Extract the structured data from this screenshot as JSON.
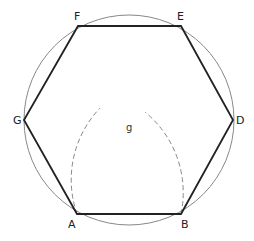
{
  "diagram": {
    "colors": {
      "background": "#ffffff",
      "hexagon_stroke": "#222222",
      "circle_stroke": "#888888",
      "arc_stroke": "#888888",
      "label": "#222222"
    },
    "circle": {
      "cx": 129,
      "cy": 120,
      "r": 105
    },
    "vertices": [
      {
        "id": "A",
        "label": "A",
        "x": 77,
        "y": 214,
        "lx": 68,
        "ly": 228
      },
      {
        "id": "B",
        "label": "B",
        "x": 181,
        "y": 214,
        "lx": 181,
        "ly": 228
      },
      {
        "id": "D",
        "label": "D",
        "x": 233,
        "y": 120,
        "lx": 236,
        "ly": 124
      },
      {
        "id": "E",
        "label": "E",
        "x": 181,
        "y": 26,
        "lx": 177,
        "ly": 20
      },
      {
        "id": "F",
        "label": "F",
        "x": 78,
        "y": 26,
        "lx": 74,
        "ly": 20
      },
      {
        "id": "G",
        "label": "G",
        "x": 24,
        "y": 120,
        "lx": 13,
        "ly": 124
      }
    ],
    "construction_point": {
      "id": "g",
      "label": "g",
      "x": 129,
      "y": 118,
      "lx": 126,
      "ly": 131
    },
    "arcs": [
      {
        "name": "arc-centered-at-B",
        "path": "M 77 214 A 104 104 0 0 1 100 108"
      },
      {
        "name": "arc-centered-at-A",
        "path": "M 181 214 A 104 104 0 0 0 145 112"
      }
    ]
  }
}
